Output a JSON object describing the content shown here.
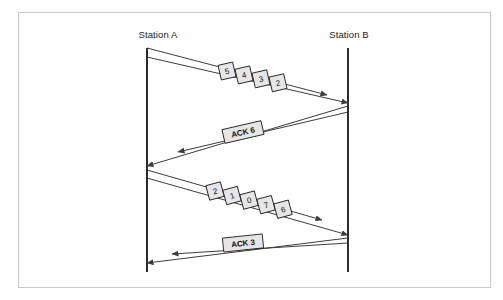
{
  "figure": {
    "type": "sequence-timing-diagram",
    "title": "",
    "background_color": "#ffffff",
    "border_color": "#c9c9c9",
    "line_color": "#3d3d3d",
    "lifeline_color": "#2b2b2b",
    "box_fill_color": "#e6e6e6",
    "box_stroke_color": "#242424"
  },
  "stations": [
    {
      "id": "station-a",
      "label": "Station A",
      "x": 147,
      "label_x": 158,
      "label_y": 38,
      "top": 48,
      "bottom": 272
    },
    {
      "id": "station-b",
      "label": "Station B",
      "x": 348,
      "label_x": 349,
      "label_y": 38,
      "top": 48,
      "bottom": 272
    }
  ],
  "transmissions": [
    {
      "id": "frames-5-4-3-2",
      "direction": "a-to-b",
      "kind": "data-frames",
      "leading_from": {
        "x": 147,
        "y": 57
      },
      "leading_to": {
        "x": 348,
        "y": 103
      },
      "trailing_from": {
        "x": 147,
        "y": 48
      },
      "trailing_to": {
        "x": 327,
        "y": 95
      },
      "frames": [
        "5",
        "4",
        "3",
        "2"
      ],
      "label_anchor": {
        "x": 227,
        "y": 71
      },
      "box_w": 15,
      "box_h": 15,
      "box_gap": 17,
      "rotation": -13
    },
    {
      "id": "ack-6",
      "direction": "b-to-a",
      "kind": "acknowledgement",
      "leading_from": {
        "x": 348,
        "y": 106
      },
      "leading_to": {
        "x": 147,
        "y": 166
      },
      "trailing_from": {
        "x": 348,
        "y": 112
      },
      "trailing_to": {
        "x": 178,
        "y": 152
      },
      "label": "ACK 6",
      "label_anchor": {
        "x": 243,
        "y": 132
      },
      "box_w": 40,
      "box_h": 14,
      "rotation": -13
    },
    {
      "id": "frames-2-1-0-7-6",
      "direction": "a-to-b",
      "kind": "data-frames",
      "leading_from": {
        "x": 147,
        "y": 178
      },
      "leading_to": {
        "x": 348,
        "y": 235
      },
      "trailing_from": {
        "x": 147,
        "y": 170
      },
      "trailing_to": {
        "x": 322,
        "y": 220
      },
      "frames": [
        "2",
        "1",
        "0",
        "7",
        "6"
      ],
      "label_anchor": {
        "x": 215,
        "y": 191
      },
      "box_w": 15,
      "box_h": 15,
      "box_gap": 17,
      "rotation": -15
    },
    {
      "id": "ack-3",
      "direction": "b-to-a",
      "kind": "acknowledgement",
      "leading_from": {
        "x": 348,
        "y": 238
      },
      "leading_to": {
        "x": 147,
        "y": 263
      },
      "trailing_from": {
        "x": 348,
        "y": 243
      },
      "trailing_to": {
        "x": 172,
        "y": 254
      },
      "label": "ACK 3",
      "label_anchor": {
        "x": 243,
        "y": 243
      },
      "box_w": 40,
      "box_h": 14,
      "rotation": -6
    }
  ]
}
